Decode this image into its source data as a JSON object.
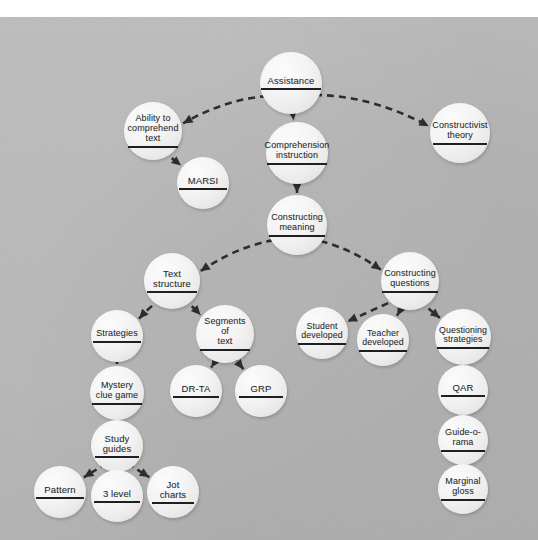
{
  "diagram": {
    "type": "concept-map",
    "background_color": "#b5b5b5",
    "node_fill_color": "#f2f2f2",
    "edge_color": "#2b2d30",
    "text_color": "#25272a",
    "edge_style": "dashed-arrow"
  },
  "nodes": [
    {
      "id": "assistance",
      "label": "Assistance",
      "cx": 291,
      "cy": 83,
      "r": 31,
      "font": 9.5,
      "rule": 60
    },
    {
      "id": "ability",
      "label": "Ability to\ncomprehend\ntext",
      "cx": 153,
      "cy": 131,
      "r": 29,
      "font": 9.0,
      "rule": 50
    },
    {
      "id": "marsi",
      "label": "MARSI",
      "cx": 203,
      "cy": 183,
      "r": 26,
      "font": 9.5,
      "rule": 48
    },
    {
      "id": "constructivist",
      "label": "Constructivist\ntheory",
      "cx": 460,
      "cy": 133,
      "r": 30,
      "font": 9.0,
      "rule": 54
    },
    {
      "id": "comprehension",
      "label": "Comprehension\ninstruction",
      "cx": 297,
      "cy": 153,
      "r": 31,
      "font": 9.0,
      "rule": 60
    },
    {
      "id": "constructing_mean",
      "label": "Constructing\nmeaning",
      "cx": 297,
      "cy": 225,
      "r": 30,
      "font": 9.0,
      "rule": 56
    },
    {
      "id": "text_structure",
      "label": "Text\nstructure",
      "cx": 172,
      "cy": 281,
      "r": 28,
      "font": 9.5,
      "rule": 50
    },
    {
      "id": "constructing_q",
      "label": "Constructing\nquestions",
      "cx": 410,
      "cy": 281,
      "r": 29,
      "font": 9.0,
      "rule": 56
    },
    {
      "id": "strategies",
      "label": "Strategies",
      "cx": 117,
      "cy": 336,
      "r": 26,
      "font": 9.0,
      "rule": 48
    },
    {
      "id": "segments",
      "label": "Segments\nof\ntext",
      "cx": 225,
      "cy": 334,
      "r": 29,
      "font": 9.0,
      "rule": 50
    },
    {
      "id": "student_dev",
      "label": "Student\ndeveloped",
      "cx": 322,
      "cy": 333,
      "r": 26,
      "font": 8.8,
      "rule": 48
    },
    {
      "id": "teacher_dev",
      "label": "Teacher\ndeveloped",
      "cx": 383,
      "cy": 340,
      "r": 26,
      "font": 8.8,
      "rule": 48
    },
    {
      "id": "questioning",
      "label": "Questioning\nstrategies",
      "cx": 463,
      "cy": 337,
      "r": 28,
      "font": 8.8,
      "rule": 52
    },
    {
      "id": "mystery",
      "label": "Mystery\nclue game",
      "cx": 117,
      "cy": 393,
      "r": 27,
      "font": 9.0,
      "rule": 50
    },
    {
      "id": "drta",
      "label": "DR-TA",
      "cx": 196,
      "cy": 391,
      "r": 26,
      "font": 9.5,
      "rule": 46
    },
    {
      "id": "grp",
      "label": "GRP",
      "cx": 261,
      "cy": 391,
      "r": 26,
      "font": 9.5,
      "rule": 44
    },
    {
      "id": "qar",
      "label": "QAR",
      "cx": 463,
      "cy": 390,
      "r": 25,
      "font": 9.5,
      "rule": 44
    },
    {
      "id": "study_guides",
      "label": "Study\nguides",
      "cx": 117,
      "cy": 446,
      "r": 26,
      "font": 9.5,
      "rule": 44
    },
    {
      "id": "guide_o_rama",
      "label": "Guide-o-\nrama",
      "cx": 463,
      "cy": 440,
      "r": 25,
      "font": 9.0,
      "rule": 44
    },
    {
      "id": "pattern",
      "label": "Pattern",
      "cx": 60,
      "cy": 492,
      "r": 26,
      "font": 9.5,
      "rule": 48
    },
    {
      "id": "three_level",
      "label": "3 level",
      "cx": 117,
      "cy": 496,
      "r": 26,
      "font": 9.5,
      "rule": 46
    },
    {
      "id": "jot_charts",
      "label": "Jot\ncharts",
      "cx": 173,
      "cy": 492,
      "r": 26,
      "font": 9.5,
      "rule": 42
    },
    {
      "id": "marginal_gloss",
      "label": "Marginal\ngloss",
      "cx": 463,
      "cy": 489,
      "r": 25,
      "font": 9.0,
      "rule": 44
    }
  ],
  "edges": [
    {
      "from": "assistance",
      "to": "ability",
      "kind": "curve"
    },
    {
      "from": "assistance",
      "to": "comprehension",
      "kind": "straight"
    },
    {
      "from": "assistance",
      "to": "constructivist",
      "kind": "curve"
    },
    {
      "from": "ability",
      "to": "marsi",
      "kind": "straight"
    },
    {
      "from": "comprehension",
      "to": "constructing_mean",
      "kind": "straight"
    },
    {
      "from": "constructing_mean",
      "to": "text_structure",
      "kind": "curve"
    },
    {
      "from": "constructing_mean",
      "to": "constructing_q",
      "kind": "curve"
    },
    {
      "from": "text_structure",
      "to": "strategies",
      "kind": "curve"
    },
    {
      "from": "text_structure",
      "to": "segments",
      "kind": "curve"
    },
    {
      "from": "strategies",
      "to": "mystery",
      "kind": "straight"
    },
    {
      "from": "segments",
      "to": "drta",
      "kind": "straight"
    },
    {
      "from": "segments",
      "to": "grp",
      "kind": "straight"
    },
    {
      "from": "mystery",
      "to": "study_guides",
      "kind": "straight"
    },
    {
      "from": "study_guides",
      "to": "pattern",
      "kind": "straight"
    },
    {
      "from": "study_guides",
      "to": "three_level",
      "kind": "straight"
    },
    {
      "from": "study_guides",
      "to": "jot_charts",
      "kind": "straight"
    },
    {
      "from": "constructing_q",
      "to": "student_dev",
      "kind": "straight"
    },
    {
      "from": "constructing_q",
      "to": "teacher_dev",
      "kind": "straight"
    },
    {
      "from": "constructing_q",
      "to": "questioning",
      "kind": "straight"
    },
    {
      "from": "questioning",
      "to": "qar",
      "kind": "straight"
    },
    {
      "from": "qar",
      "to": "guide_o_rama",
      "kind": "straight"
    },
    {
      "from": "guide_o_rama",
      "to": "marginal_gloss",
      "kind": "straight"
    }
  ]
}
